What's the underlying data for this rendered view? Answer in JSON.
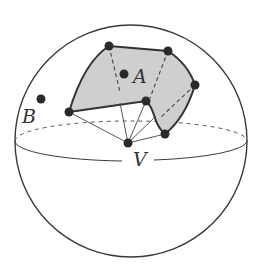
{
  "diagram": {
    "colors": {
      "stroke": "#3a3a3a",
      "fill": "#cfcfcf",
      "dot": "#2a2a2a",
      "background": "#ffffff"
    },
    "sphere": {
      "cx": 131,
      "cy": 141,
      "r": 116
    },
    "equator": {
      "cx": 131,
      "cy": 141,
      "rx": 116,
      "ry": 20
    },
    "labels": {
      "A": "A",
      "B": "B",
      "V": "V"
    },
    "points": {
      "A": {
        "x": 124,
        "y": 74
      },
      "B": {
        "x": 41,
        "y": 99
      },
      "V": {
        "x": 128,
        "y": 143
      }
    },
    "polygon_vertices": [
      {
        "name": "P1",
        "x": 109,
        "y": 46
      },
      {
        "name": "P2",
        "x": 168,
        "y": 51
      },
      {
        "name": "P3",
        "x": 195,
        "y": 85
      },
      {
        "name": "P4",
        "x": 165,
        "y": 134
      },
      {
        "name": "P5",
        "x": 146,
        "y": 101
      },
      {
        "name": "P6",
        "x": 69,
        "y": 112
      }
    ]
  }
}
